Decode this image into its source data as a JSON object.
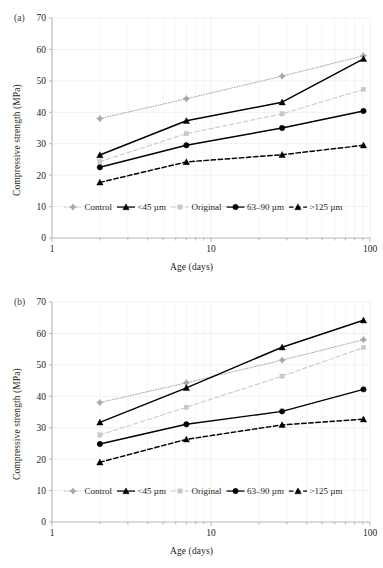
{
  "figure": {
    "panels": [
      {
        "tag": "(a)",
        "xlabel": "Age (days)",
        "ylabel": "Compressive strength (MPa)",
        "yticks": [
          "0",
          "10",
          "20",
          "30",
          "40",
          "50",
          "60",
          "70"
        ],
        "xticks": [
          "1",
          "10",
          "100"
        ]
      },
      {
        "tag": "(b)",
        "xlabel": "Age (days)",
        "ylabel": "Compressive strength (MPa)",
        "yticks": [
          "0",
          "10",
          "20",
          "30",
          "40",
          "50",
          "60",
          "70"
        ],
        "xticks": [
          "1",
          "10",
          "100"
        ]
      }
    ],
    "legend": [
      {
        "label": "Control",
        "marker": "diamond-marker",
        "line": "dotted",
        "color": "#a8a8ac"
      },
      {
        "label": "<45 µm",
        "marker": "triangle-marker",
        "line": "solid",
        "color": "#000000"
      },
      {
        "label": "Original",
        "marker": "square-marker",
        "line": "dashed",
        "color": "#c9c9cd"
      },
      {
        "label": "63–90 µm",
        "marker": "circle-marker",
        "line": "solid",
        "color": "#000000"
      },
      {
        "label": ">125 µm",
        "marker": "triangle-marker",
        "line": "dashed",
        "color": "#000000"
      }
    ]
  },
  "chart_data": [
    {
      "type": "line",
      "panel": "(a)",
      "title": "",
      "xlabel": "Age (days)",
      "ylabel": "Compressive strength (MPa)",
      "xscale": "log",
      "xlim": [
        1,
        100
      ],
      "ylim": [
        0,
        70
      ],
      "yticks": [
        0,
        10,
        20,
        30,
        40,
        50,
        60,
        70
      ],
      "xticks": [
        1,
        10,
        100
      ],
      "grid": true,
      "legend_position": "inside-bottom-left",
      "x": [
        2,
        7,
        28,
        91
      ],
      "series": [
        {
          "name": "Control",
          "values": [
            38.0,
            44.3,
            51.5,
            58.0
          ],
          "color": "#a8a8ac",
          "line": "dotted",
          "marker": "diamond"
        },
        {
          "name": "<45 µm",
          "values": [
            26.4,
            37.3,
            43.2,
            57.0
          ],
          "color": "#000000",
          "line": "solid",
          "marker": "triangle"
        },
        {
          "name": "Original",
          "values": [
            24.3,
            33.2,
            39.5,
            47.3
          ],
          "color": "#c9c9cd",
          "line": "dashed",
          "marker": "square"
        },
        {
          "name": "63–90 µm",
          "values": [
            22.5,
            29.5,
            35.0,
            40.4
          ],
          "color": "#000000",
          "line": "solid",
          "marker": "circle"
        },
        {
          "name": ">125 µm",
          "values": [
            17.7,
            24.2,
            26.5,
            29.5
          ],
          "color": "#000000",
          "line": "dashed",
          "marker": "triangle"
        }
      ]
    },
    {
      "type": "line",
      "panel": "(b)",
      "title": "",
      "xlabel": "Age (days)",
      "ylabel": "Compressive strength (MPa)",
      "xscale": "log",
      "xlim": [
        1,
        100
      ],
      "ylim": [
        0,
        70
      ],
      "yticks": [
        0,
        10,
        20,
        30,
        40,
        50,
        60,
        70
      ],
      "xticks": [
        1,
        10,
        100
      ],
      "grid": true,
      "legend_position": "inside-bottom-left",
      "x": [
        2,
        7,
        28,
        91
      ],
      "series": [
        {
          "name": "Control",
          "values": [
            38.0,
            44.3,
            51.5,
            58.0
          ],
          "color": "#a8a8ac",
          "line": "dotted",
          "marker": "diamond"
        },
        {
          "name": "<45 µm",
          "values": [
            31.7,
            42.7,
            55.6,
            64.2
          ],
          "color": "#000000",
          "line": "solid",
          "marker": "triangle"
        },
        {
          "name": "Original",
          "values": [
            27.7,
            36.5,
            46.4,
            55.5
          ],
          "color": "#c9c9cd",
          "line": "dashed",
          "marker": "square"
        },
        {
          "name": "63–90 µm",
          "values": [
            24.8,
            31.1,
            35.2,
            42.2
          ],
          "color": "#000000",
          "line": "solid",
          "marker": "circle"
        },
        {
          "name": ">125 µm",
          "values": [
            19.0,
            26.3,
            30.9,
            32.7
          ],
          "color": "#000000",
          "line": "dashed",
          "marker": "triangle"
        }
      ]
    }
  ]
}
